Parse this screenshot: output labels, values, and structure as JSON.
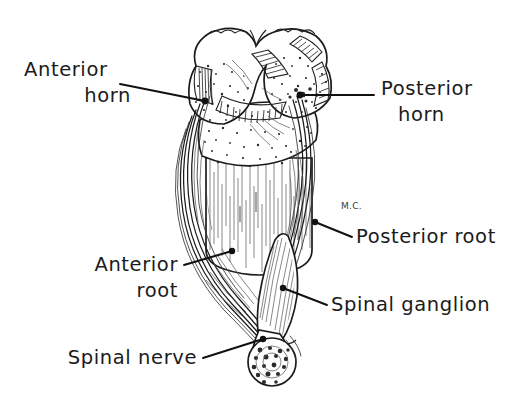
{
  "figure": {
    "background_color": "#ffffff",
    "ink_color": "#1b1b1b",
    "signature": "M.C.",
    "style": "pen-and-ink line drawing, stippled and hatched"
  },
  "labels": [
    {
      "id": "anterior-horn",
      "line1": "Anterior",
      "line2": "horn",
      "align": "left",
      "text_x": 24,
      "text_y1": 76,
      "text_y2": 102,
      "leader": "M 120,84 L 205,101",
      "marker_x": 205,
      "marker_y": 101
    },
    {
      "id": "posterior-horn",
      "line1": "Posterior",
      "line2": "horn",
      "align": "left",
      "text_x": 381,
      "text_y1": 95,
      "text_y2": 121,
      "leader": "M 374,95 L 300,95",
      "marker_x": 300,
      "marker_y": 95
    },
    {
      "id": "posterior-root",
      "line1": "Posterior root",
      "line2": "",
      "align": "left",
      "text_x": 356,
      "text_y1": 243,
      "text_y2": 0,
      "leader": "M 352,237 L 315,222",
      "marker_x": 315,
      "marker_y": 222
    },
    {
      "id": "anterior-root",
      "line1": "Anterior",
      "line2": "root",
      "align": "right",
      "text_x": 178,
      "text_y1": 271,
      "text_y2": 297,
      "leader": "M 184,265 L 232,251",
      "marker_x": 232,
      "marker_y": 251
    },
    {
      "id": "spinal-ganglion",
      "line1": "Spinal  ganglion",
      "line2": "",
      "align": "left",
      "text_x": 331,
      "text_y1": 311,
      "text_y2": 0,
      "leader": "M 327,305 L 283,288",
      "marker_x": 283,
      "marker_y": 288
    },
    {
      "id": "spinal-nerve",
      "line1": "Spinal  nerve",
      "line2": "",
      "align": "right",
      "text_x": 197,
      "text_y1": 364,
      "text_y2": 0,
      "leader": "M 203,358 L 263,339",
      "marker_x": 263,
      "marker_y": 339
    }
  ]
}
